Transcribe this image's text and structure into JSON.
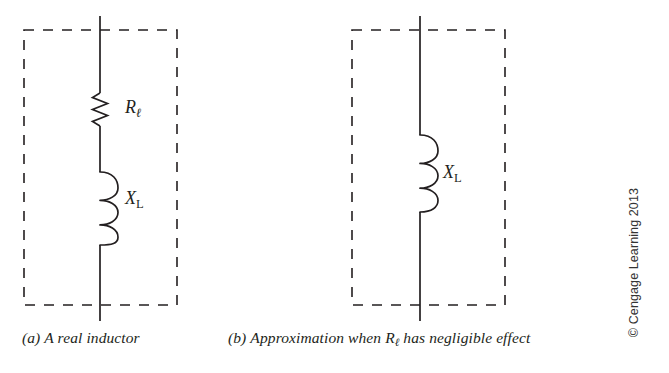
{
  "figure": {
    "background_color": "#ffffff",
    "ink_color": "#231f20",
    "panels": [
      {
        "id": "a",
        "caption_prefix": "(a)",
        "caption_text": "A real inductor",
        "caption_full": "(a) A real inductor",
        "dashed_box": {
          "x": 24,
          "y": 30,
          "width": 153,
          "height": 275
        },
        "lead_line": {
          "x": 100,
          "y_top": 16,
          "y_bottom": 321
        },
        "components": [
          {
            "type": "resistor",
            "label_base": "R",
            "label_subscript": "ℓ",
            "label_full": "Rℓ",
            "orientation": "vertical",
            "x": 100,
            "y_top": 93,
            "y_bottom": 128
          },
          {
            "type": "inductor",
            "label_base": "X",
            "label_subscript": "L",
            "label_full": "XL",
            "orientation": "vertical",
            "coils": 3,
            "x": 100,
            "y_top": 172,
            "y_bottom": 245
          }
        ]
      },
      {
        "id": "b",
        "caption_prefix": "(b)",
        "caption_text_before": "Approximation when ",
        "caption_symbol_base": "R",
        "caption_symbol_subscript": "ℓ",
        "caption_text_after": " has negligible effect",
        "caption_full": "(b) Approximation when Rℓ has negligible effect",
        "dashed_box": {
          "x": 352,
          "y": 30,
          "width": 153,
          "height": 275
        },
        "lead_line": {
          "x": 420,
          "y_top": 16,
          "y_bottom": 321
        },
        "components": [
          {
            "type": "inductor",
            "label_base": "X",
            "label_subscript": "L",
            "label_full": "XL",
            "orientation": "vertical",
            "coils": 3,
            "x": 420,
            "y_top": 135,
            "y_bottom": 212
          }
        ]
      }
    ],
    "credit": "© Cengage Learning 2013"
  }
}
